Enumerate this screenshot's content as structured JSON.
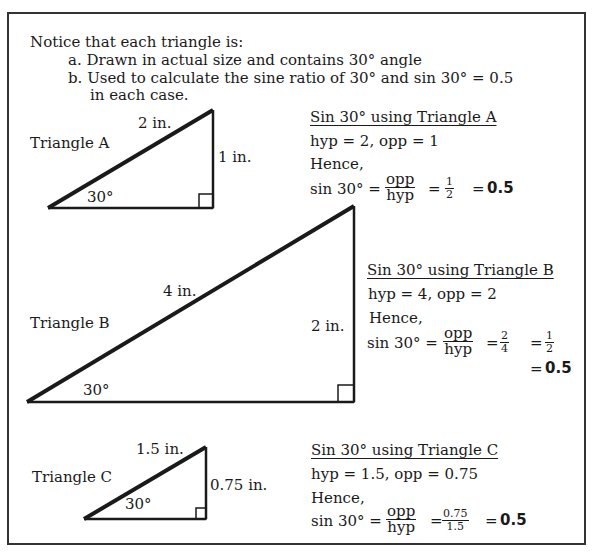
{
  "intro": {
    "heading": "Notice that each triangle is:",
    "item_a": "a. Drawn in actual size and contains 30° angle",
    "item_b": "b. Used to calculate the sine ratio of 30° and sin 30° = 0.5",
    "item_b_cont": "in each case."
  },
  "triangles": [
    {
      "name": "Triangle A",
      "hyp_label": "2 in.",
      "opp_label": "1 in.",
      "angle_label": "30°",
      "calc": {
        "title": "Sin 30° using Triangle A",
        "given": "hyp = 2,  opp = 1",
        "hence": "Hence,",
        "lhs": "sin 30° =",
        "frac1_num": "opp",
        "frac1_den": "hyp",
        "eq": "=",
        "frac2_num": "1",
        "frac2_den": "2",
        "result_eq": "=",
        "result": "0.5"
      }
    },
    {
      "name": "Triangle B",
      "hyp_label": "4 in.",
      "opp_label": "2 in.",
      "angle_label": "30°",
      "calc": {
        "title": "Sin 30° using Triangle B",
        "given": "hyp = 4,  opp = 2",
        "hence": "Hence,",
        "lhs": "sin 30° =",
        "frac1_num": "opp",
        "frac1_den": "hyp",
        "eq": "=",
        "frac2_num": "2",
        "frac2_den": "4",
        "eq2": "=",
        "frac3_num": "1",
        "frac3_den": "2",
        "result_eq": "=",
        "result": "0.5"
      }
    },
    {
      "name": "Triangle C",
      "hyp_label": "1.5 in.",
      "opp_label": "0.75 in.",
      "angle_label": "30°",
      "calc": {
        "title": "Sin 30° using Triangle C",
        "given": "hyp = 1.5,  opp = 0.75",
        "hence": "Hence,",
        "lhs": "sin 30° =",
        "frac1_num": "opp",
        "frac1_den": "hyp",
        "eq": "=",
        "frac2_num": "0.75",
        "frac2_den": "1.5",
        "result_eq": "=",
        "result": "0.5"
      }
    }
  ]
}
